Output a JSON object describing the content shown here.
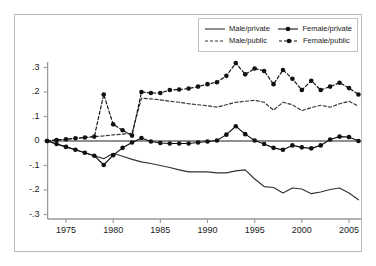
{
  "chart_data": {
    "type": "line",
    "title": "",
    "xlabel": "",
    "ylabel": "",
    "xlim": [
      1973,
      2006
    ],
    "ylim": [
      -0.32,
      0.34
    ],
    "xticks": [
      1975,
      1980,
      1985,
      1990,
      1995,
      2000,
      2005
    ],
    "xtick_labels": [
      "1975",
      "1980",
      "1985",
      "1990",
      "1995",
      "2000",
      "2005"
    ],
    "yticks": [
      -0.3,
      -0.2,
      -0.1,
      0,
      0.1,
      0.2,
      0.3
    ],
    "ytick_labels": [
      "-.3",
      "-.2",
      "-.1",
      "0",
      ".1",
      ".2",
      ".3"
    ],
    "grid": false,
    "zero_line": true,
    "legend_position": "top-right",
    "x": [
      1973,
      1974,
      1975,
      1976,
      1977,
      1978,
      1979,
      1980,
      1981,
      1982,
      1983,
      1984,
      1985,
      1986,
      1987,
      1988,
      1989,
      1990,
      1991,
      1992,
      1993,
      1994,
      1995,
      1996,
      1997,
      1998,
      1999,
      2000,
      2001,
      2002,
      2003,
      2004,
      2005,
      2006
    ],
    "series": [
      {
        "name": "Male/private",
        "style": "solid",
        "markers": false,
        "color": "#333333",
        "values": [
          0.0,
          -0.012,
          -0.024,
          -0.036,
          -0.048,
          -0.06,
          -0.072,
          -0.05,
          -0.062,
          -0.075,
          -0.085,
          -0.092,
          -0.1,
          -0.108,
          -0.118,
          -0.126,
          -0.126,
          -0.126,
          -0.13,
          -0.13,
          -0.122,
          -0.118,
          -0.155,
          -0.186,
          -0.19,
          -0.212,
          -0.192,
          -0.196,
          -0.215,
          -0.208,
          -0.198,
          -0.192,
          -0.212,
          -0.24
        ]
      },
      {
        "name": "Male/public",
        "style": "dashed",
        "markers": false,
        "color": "#333333",
        "values": [
          0.0,
          0.004,
          0.007,
          0.011,
          0.014,
          0.018,
          0.021,
          0.025,
          0.028,
          0.032,
          0.175,
          0.172,
          0.168,
          0.162,
          0.158,
          0.152,
          0.148,
          0.144,
          0.138,
          0.148,
          0.158,
          0.162,
          0.166,
          0.158,
          0.126,
          0.158,
          0.148,
          0.124,
          0.136,
          0.146,
          0.138,
          0.152,
          0.162,
          0.142
        ]
      },
      {
        "name": "Female/private",
        "style": "solid",
        "markers": true,
        "color": "#111111",
        "values": [
          0.0,
          -0.012,
          -0.024,
          -0.036,
          -0.048,
          -0.06,
          -0.098,
          -0.058,
          -0.028,
          -0.006,
          0.012,
          -0.002,
          -0.008,
          -0.01,
          -0.01,
          -0.01,
          -0.006,
          -0.002,
          0.002,
          0.026,
          0.06,
          0.028,
          0.002,
          -0.012,
          -0.028,
          -0.036,
          -0.018,
          -0.026,
          -0.03,
          -0.018,
          0.006,
          0.018,
          0.016,
          0.0
        ]
      },
      {
        "name": "Female/public",
        "style": "dashed",
        "markers": true,
        "color": "#111111",
        "values": [
          0.0,
          0.004,
          0.007,
          0.011,
          0.014,
          0.018,
          0.19,
          0.068,
          0.044,
          0.022,
          0.2,
          0.196,
          0.196,
          0.208,
          0.21,
          0.214,
          0.222,
          0.232,
          0.24,
          0.266,
          0.318,
          0.272,
          0.296,
          0.286,
          0.232,
          0.29,
          0.254,
          0.208,
          0.246,
          0.208,
          0.222,
          0.238,
          0.216,
          0.19
        ]
      }
    ]
  },
  "legend": {
    "items": [
      {
        "label": "Male/private",
        "style": "solid",
        "markers": false
      },
      {
        "label": "Female/private",
        "style": "solid",
        "markers": true
      },
      {
        "label": "Male/public",
        "style": "dashed",
        "markers": false
      },
      {
        "label": "Female/public",
        "style": "dashed",
        "markers": true
      }
    ]
  }
}
